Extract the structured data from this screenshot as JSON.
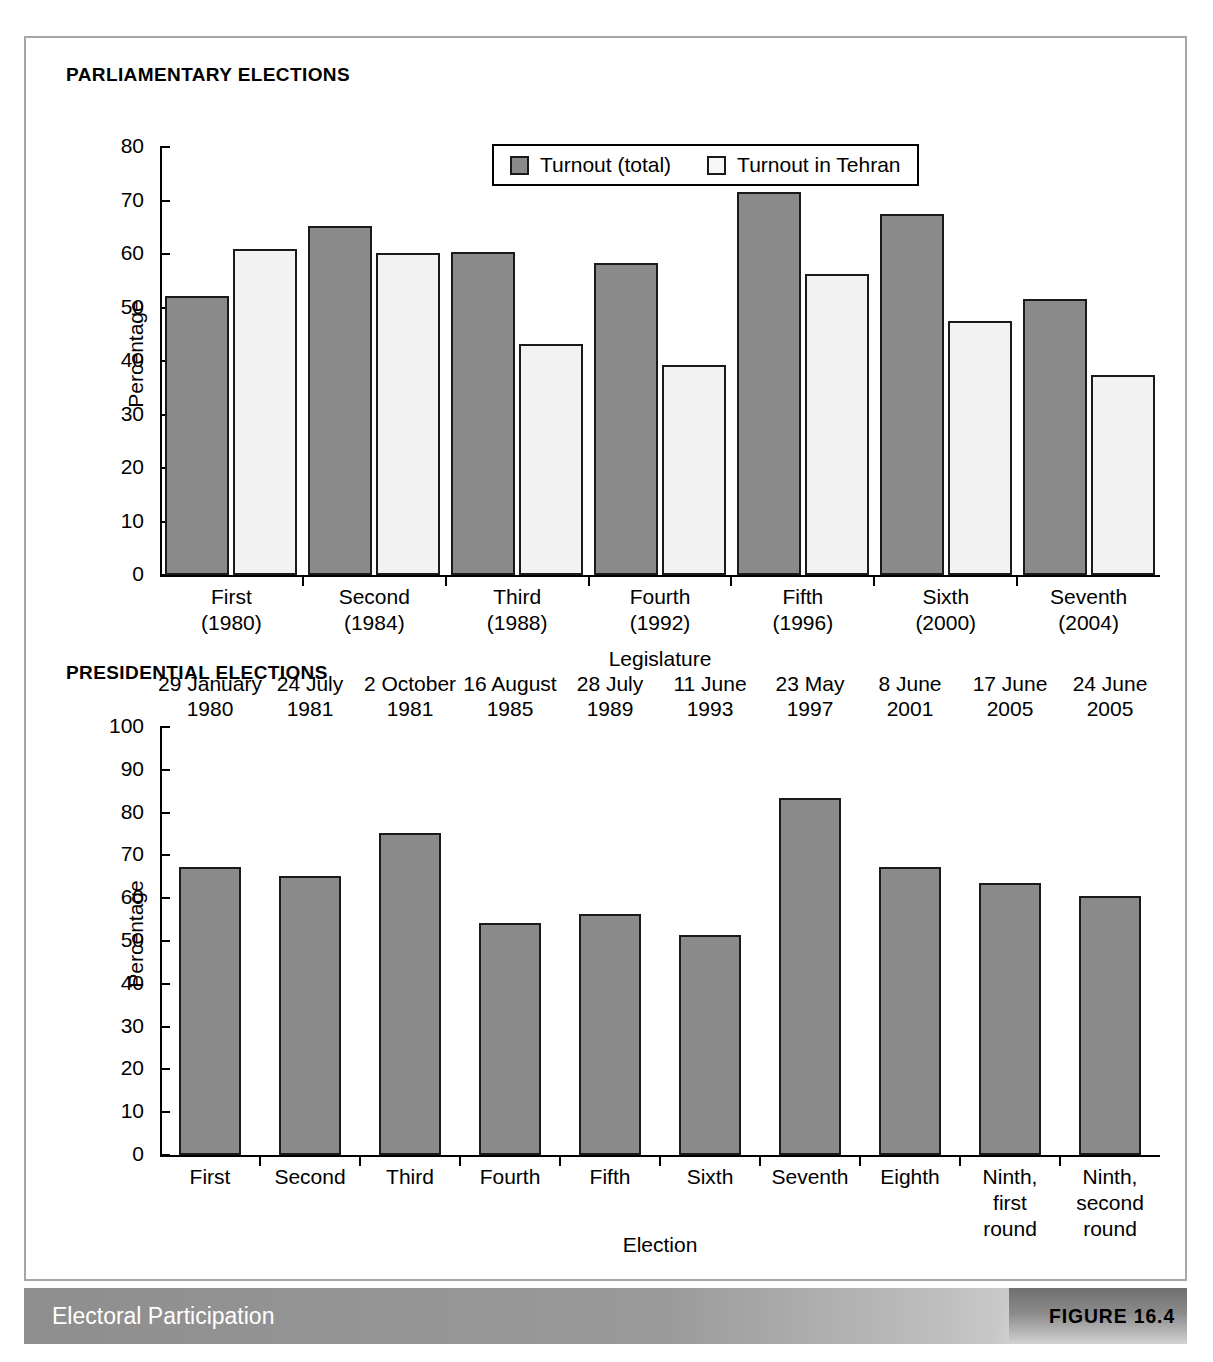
{
  "figure": {
    "caption": "Electoral Participation",
    "number": "FIGURE 16.4"
  },
  "panels": {
    "parliamentary": {
      "title": "PARLIAMENTARY ELECTIONS",
      "legend": [
        {
          "label": "Turnout (total)",
          "swatch": "gray"
        },
        {
          "label": "Turnout in Tehran",
          "swatch": "white"
        }
      ]
    },
    "presidential": {
      "title": "PRESIDENTIAL ELECTIONS"
    }
  },
  "chart_data": [
    {
      "type": "bar",
      "title": "PARLIAMENTARY ELECTIONS",
      "xlabel": "Legislature",
      "ylabel": "Percentage",
      "ylim": [
        0,
        80
      ],
      "yticks": [
        0,
        10,
        20,
        30,
        40,
        50,
        60,
        70,
        80
      ],
      "grid": false,
      "legend_position": "top-center",
      "categories": [
        "First\n(1980)",
        "Second\n(1984)",
        "Third\n(1988)",
        "Fourth\n(1992)",
        "Fifth\n(1996)",
        "Sixth\n(2000)",
        "Seventh\n(2004)"
      ],
      "category_lines": [
        [
          "First",
          "(1980)"
        ],
        [
          "Second",
          "(1984)"
        ],
        [
          "Third",
          "(1988)"
        ],
        [
          "Fourth",
          "(1992)"
        ],
        [
          "Fifth",
          "(1996)"
        ],
        [
          "Sixth",
          "(2000)"
        ],
        [
          "Seventh",
          "(2004)"
        ]
      ],
      "series": [
        {
          "name": "Turnout (total)",
          "color": "#8a8a8a",
          "values": [
            52.2,
            65.2,
            60.4,
            58.4,
            71.5,
            67.5,
            51.5
          ]
        },
        {
          "name": "Turnout in Tehran",
          "color": "#f2f2f2",
          "values": [
            61.0,
            60.1,
            43.2,
            39.3,
            56.2,
            47.4,
            37.4
          ]
        }
      ]
    },
    {
      "type": "bar",
      "title": "PRESIDENTIAL ELECTIONS",
      "xlabel": "Election",
      "ylabel": "Percentage",
      "ylim": [
        0,
        100
      ],
      "yticks": [
        0,
        10,
        20,
        30,
        40,
        50,
        60,
        70,
        80,
        90,
        100
      ],
      "grid": false,
      "categories": [
        "First",
        "Second",
        "Third",
        "Fourth",
        "Fifth",
        "Sixth",
        "Seventh",
        "Eighth",
        "Ninth, first round",
        "Ninth, second round"
      ],
      "category_lines": [
        [
          "First"
        ],
        [
          "Second"
        ],
        [
          "Third"
        ],
        [
          "Fourth"
        ],
        [
          "Fifth"
        ],
        [
          "Sixth"
        ],
        [
          "Seventh"
        ],
        [
          "Eighth"
        ],
        [
          "Ninth,",
          "first",
          "round"
        ],
        [
          "Ninth,",
          "second",
          "round"
        ]
      ],
      "point_labels": [
        [
          "29 January",
          "1980"
        ],
        [
          "24 July",
          "1981"
        ],
        [
          "2 October",
          "1981"
        ],
        [
          "16 August",
          "1985"
        ],
        [
          "28 July",
          "1989"
        ],
        [
          "11 June",
          "1993"
        ],
        [
          "23 May",
          "1997"
        ],
        [
          "8 June",
          "2001"
        ],
        [
          "17 June",
          "2005"
        ],
        [
          "24 June",
          "2005"
        ]
      ],
      "series": [
        {
          "name": "Turnout",
          "color": "#8a8a8a",
          "values": [
            67.2,
            65.1,
            75.3,
            54.3,
            56.3,
            51.4,
            83.5,
            67.4,
            63.5,
            60.6
          ]
        }
      ]
    }
  ]
}
